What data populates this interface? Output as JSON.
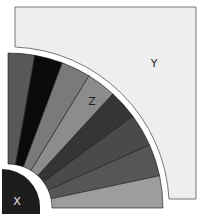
{
  "diagram": {
    "regions": {
      "x": {
        "label": "X",
        "fill": "#1c1c1c",
        "text_color": "#e8e8e8"
      },
      "y": {
        "label": "Y",
        "fill": "#eeeeee",
        "text_color": "#222222",
        "stroke": "#777777"
      },
      "z": {
        "label": "Z",
        "text_color": "#222222"
      }
    },
    "fan": {
      "center": [
        8,
        208
      ],
      "inner_radius": 44,
      "outer_radius": 155,
      "wedges": [
        {
          "start_deg": 0,
          "end_deg": 10,
          "fill": "#585858"
        },
        {
          "start_deg": 10,
          "end_deg": 20.5,
          "fill": "#0a0a0a"
        },
        {
          "start_deg": 20.5,
          "end_deg": 31.5,
          "fill": "#7a7a7a"
        },
        {
          "start_deg": 31.5,
          "end_deg": 42.6,
          "fill": "#8c8c8c"
        },
        {
          "start_deg": 42.6,
          "end_deg": 53.7,
          "fill": "#353535"
        },
        {
          "start_deg": 53.7,
          "end_deg": 66,
          "fill": "#4a4a4a"
        },
        {
          "start_deg": 66,
          "end_deg": 78,
          "fill": "#565656"
        },
        {
          "start_deg": 78,
          "end_deg": 90,
          "fill": "#9d9d9d"
        }
      ]
    }
  }
}
